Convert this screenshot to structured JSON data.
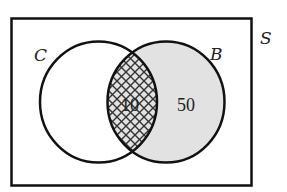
{
  "diagram": {
    "type": "venn",
    "universe": {
      "label": "S"
    },
    "sets": [
      {
        "id": "C",
        "label": "C"
      },
      {
        "id": "B",
        "label": "B"
      }
    ],
    "regions": [
      {
        "name": "C-and-B",
        "value": "10",
        "fill": "crosshatch"
      },
      {
        "name": "B-only",
        "value": "50",
        "fill": "shaded-gray"
      }
    ],
    "colors": {
      "stroke": "#111111",
      "shade": "#e2e2e2",
      "hatch": "#333333",
      "background": "#ffffff"
    }
  }
}
